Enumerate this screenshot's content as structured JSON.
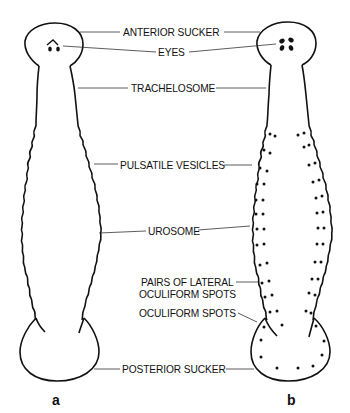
{
  "figure": {
    "panels": [
      {
        "id": "a",
        "label": "a"
      },
      {
        "id": "b",
        "label": "b"
      }
    ],
    "labels": {
      "anterior_sucker": "ANTERIOR SUCKER",
      "eyes": "EYES",
      "trachelosome": "TRACHELOSOME",
      "pulsatile_vesicles": "PULSATILE VESICLES",
      "urosome": "UROSOME",
      "pairs_lateral_line1": "PAIRS OF LATERAL",
      "pairs_lateral_line2": "OCULIFORM SPOTS",
      "oculiform_spots": "OCULIFORM SPOTS",
      "posterior_sucker": "POSTERIOR SUCKER"
    },
    "colors": {
      "ink": "#111111",
      "background": "#ffffff"
    }
  }
}
